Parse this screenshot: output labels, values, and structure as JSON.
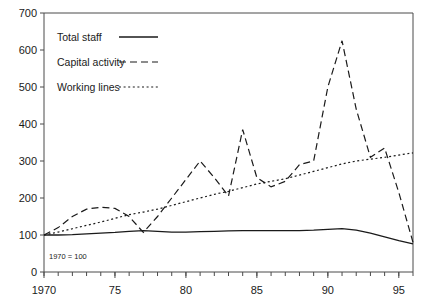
{
  "chart_data": {
    "type": "line",
    "title": "",
    "subtitle": "",
    "xlabel": "",
    "ylabel": "",
    "annotation": "1970 = 100",
    "xlim": [
      1970,
      1996
    ],
    "ylim": [
      0,
      700
    ],
    "ytick_step": 100,
    "grid": false,
    "legend_position": "top-left",
    "x_major_ticks": [
      1970,
      1975,
      1980,
      1985,
      1990,
      1995
    ],
    "x_major_tick_labels": [
      "1970",
      "75",
      "80",
      "85",
      "90",
      "95"
    ],
    "x_minor_tick_step": 1,
    "y_ticks": [
      0,
      100,
      200,
      300,
      400,
      500,
      600,
      700
    ],
    "y_tick_labels": [
      "0",
      "100",
      "200",
      "300",
      "400",
      "500",
      "600",
      "700"
    ],
    "x": [
      1970,
      1971,
      1972,
      1973,
      1974,
      1975,
      1976,
      1977,
      1978,
      1979,
      1980,
      1981,
      1982,
      1983,
      1984,
      1985,
      1986,
      1987,
      1988,
      1989,
      1990,
      1991,
      1992,
      1993,
      1994,
      1995,
      1996
    ],
    "series": [
      {
        "name": "Total staff",
        "style": "solid",
        "values": [
          100,
          100,
          101,
          103,
          105,
          107,
          110,
          112,
          110,
          108,
          108,
          109,
          110,
          111,
          112,
          112,
          112,
          112,
          112,
          113,
          115,
          117,
          113,
          105,
          95,
          85,
          76
        ]
      },
      {
        "name": "Capital activity",
        "style": "dashed",
        "values": [
          100,
          120,
          150,
          170,
          175,
          172,
          150,
          107,
          150,
          200,
          250,
          300,
          255,
          205,
          385,
          255,
          230,
          245,
          290,
          300,
          500,
          625,
          440,
          310,
          335,
          215,
          80
        ]
      },
      {
        "name": "Working lines",
        "style": "dotted",
        "values": [
          100,
          108,
          117,
          126,
          135,
          145,
          155,
          162,
          170,
          180,
          190,
          200,
          210,
          218,
          228,
          238,
          245,
          252,
          262,
          272,
          282,
          292,
          300,
          305,
          310,
          316,
          322
        ]
      }
    ]
  },
  "legend": {
    "items": [
      {
        "label": "Total staff",
        "style": "solid"
      },
      {
        "label": "Capital activity",
        "style": "dashed"
      },
      {
        "label": "Working lines",
        "style": "dotted"
      }
    ]
  }
}
